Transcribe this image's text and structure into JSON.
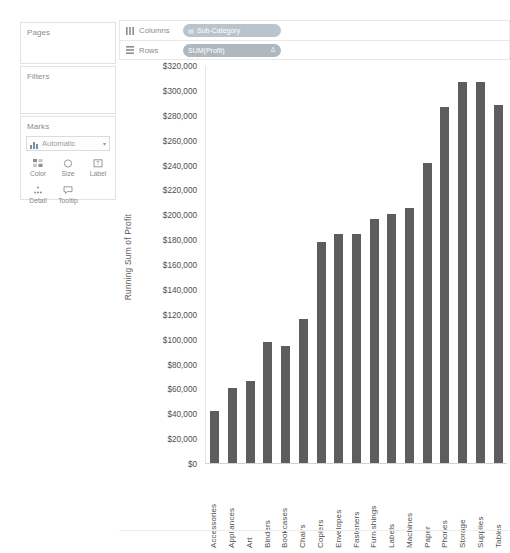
{
  "sidebar": {
    "pages": {
      "title": "Pages"
    },
    "filters": {
      "title": "Filters"
    },
    "marks": {
      "title": "Marks",
      "mark_type": "Automatic",
      "mark_type_icon": "bar-chart-icon",
      "caret_icon": "chevron-down-icon",
      "buttons": [
        {
          "label": "Color",
          "icon": "color-icon"
        },
        {
          "label": "Size",
          "icon": "size-icon"
        },
        {
          "label": "Label",
          "icon": "label-icon"
        },
        {
          "label": "Detail",
          "icon": "detail-icon"
        },
        {
          "label": "Tooltip",
          "icon": "tooltip-icon"
        }
      ]
    }
  },
  "shelves": {
    "columns": {
      "label": "Columns",
      "icon": "columns-icon",
      "pill": {
        "text": "Sub-Category",
        "lead_icon": "dimension-grid-icon",
        "type": "dimension"
      }
    },
    "rows": {
      "label": "Rows",
      "icon": "rows-icon",
      "pill": {
        "text": "SUM(Profit)",
        "delta_icon": "table-calc-delta-icon",
        "type": "measure"
      }
    }
  },
  "chart_data": {
    "type": "bar",
    "title": "",
    "xlabel": "",
    "ylabel": "Running Sum of Profit",
    "ylim": [
      0,
      320000
    ],
    "ytick_step": 20000,
    "grid": false,
    "legend": "none",
    "bar_color": "#5d5d5d",
    "ytick_labels": [
      "$320,000",
      "$300,000",
      "$280,000",
      "$260,000",
      "$240,000",
      "$220,000",
      "$200,000",
      "$180,000",
      "$160,000",
      "$140,000",
      "$120,000",
      "$100,000",
      "$80,000",
      "$60,000",
      "$40,000",
      "$20,000",
      "$0"
    ],
    "ytick_values": [
      320000,
      300000,
      280000,
      260000,
      240000,
      220000,
      200000,
      180000,
      160000,
      140000,
      120000,
      100000,
      80000,
      60000,
      40000,
      20000,
      0
    ],
    "categories": [
      "Accessories",
      "Appliances",
      "Art",
      "Binders",
      "Bookcases",
      "Chairs",
      "Copiers",
      "Envelopes",
      "Fasteners",
      "Furnishings",
      "Labels",
      "Machines",
      "Paper",
      "Phones",
      "Storage",
      "Supplies",
      "Tables"
    ],
    "values": [
      42000,
      60000,
      66000,
      97000,
      94000,
      116000,
      178000,
      184000,
      184000,
      196000,
      200000,
      205000,
      241000,
      286000,
      306000,
      306000,
      288000
    ]
  }
}
